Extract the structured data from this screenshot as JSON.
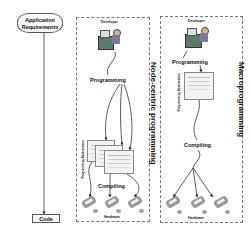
{
  "left": {
    "requirements_line1": "Application",
    "requirements_line2": "Requirements",
    "output": "Code"
  },
  "node_centric": {
    "title": "Node-centric programming",
    "developer": "Developer",
    "programming": "Programming",
    "artifact_label": "Programming Abstractions",
    "compiling": "Compiling",
    "hardware": "Hardware",
    "node_count": 3
  },
  "macro": {
    "title": "Macroprogramming",
    "developer": "Developer",
    "programming": "Programming",
    "artifact_label": "Programming Abstractions",
    "compiling": "Compiling",
    "hardware": "Hardware",
    "node_count": 3
  },
  "colors": {
    "border": "#777777",
    "desk": "#5a7a6a",
    "node": "#9a9a9a"
  }
}
